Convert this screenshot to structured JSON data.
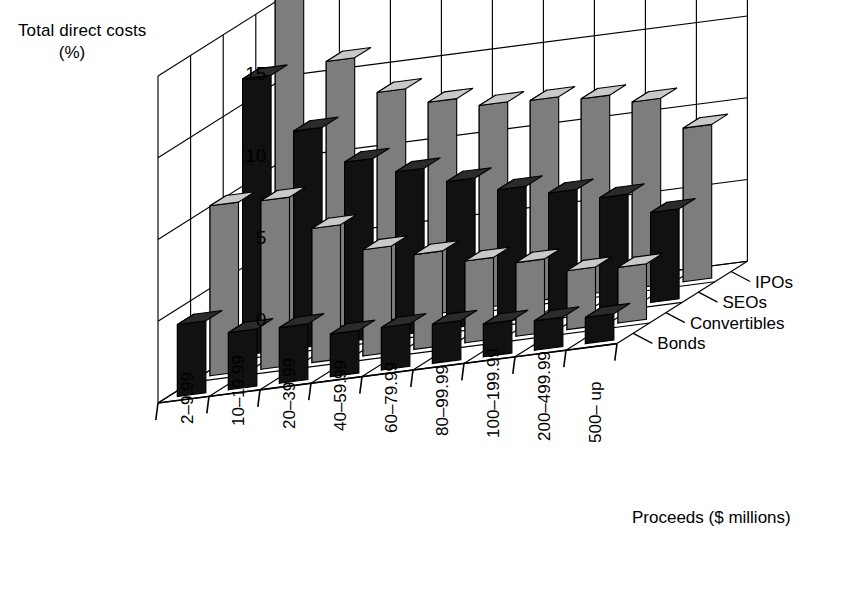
{
  "chart_data": {
    "type": "bar",
    "title": "",
    "ylabel": "Total direct costs (%)",
    "ylabel_line1": "Total direct costs",
    "ylabel_line2": "(%)",
    "xlabel": "Proceeds ($ millions)",
    "ylim": [
      0,
      20
    ],
    "yticks": [
      0,
      5,
      10,
      15,
      20
    ],
    "ytick_labels": [
      "0",
      "5",
      "10",
      "15",
      "20"
    ],
    "grid": true,
    "legend_position": "right",
    "projection": "3d-axonometric",
    "categories": [
      "2–9.99",
      "10–19.99",
      "20–39.99",
      "40–59.99",
      "60–79.99",
      "80–99.99",
      "100–199.99",
      "200–499.99",
      "500– up"
    ],
    "series": [
      {
        "name": "IPOs",
        "fill": "gray",
        "values": [
          21.2,
          16.3,
          14.0,
          13.0,
          12.4,
          12.3,
          12.0,
          11.4,
          9.4
        ]
      },
      {
        "name": "SEOs",
        "fill": "black",
        "values": [
          16.9,
          13.3,
          11.0,
          10.0,
          9.0,
          8.1,
          7.5,
          6.8,
          5.5
        ]
      },
      {
        "name": "Convertibles",
        "fill": "gray",
        "values": [
          10.4,
          10.3,
          8.2,
          6.5,
          5.8,
          5.0,
          4.5,
          3.6,
          3.4
        ]
      },
      {
        "name": "Bonds",
        "fill": "black",
        "values": [
          4.4,
          3.5,
          3.4,
          2.6,
          2.6,
          2.4,
          2.0,
          1.8,
          1.6
        ]
      }
    ],
    "legend_entries": [
      "IPOs",
      "SEOs",
      "Convertibles",
      "Bonds"
    ],
    "colors": {
      "bar_dark": "#111111",
      "bar_gray": "#7d7d7d",
      "bar_gray_top": "#c9c9c9",
      "bar_gray_left": "#ffffff",
      "bar_dark_top": "#2b2b2b",
      "bar_dark_left": "#0a0a0a",
      "axis": "#000000",
      "background": "#ffffff"
    }
  },
  "axis": {
    "y_title_line1": "Total direct costs",
    "y_title_line2": "(%)",
    "x_title": "Proceeds ($ millions)"
  }
}
